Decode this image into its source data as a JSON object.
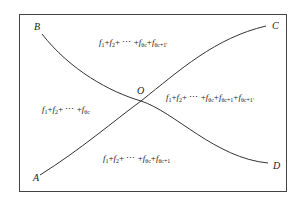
{
  "frame": {
    "x": 19,
    "y": 14,
    "width": 267,
    "height": 177,
    "stroke": "#444444"
  },
  "curves": {
    "BD": {
      "from": "B",
      "to": "D",
      "path": "M42,34 C70,70 110,92 141,101 C175,112 215,158 268,163"
    },
    "AC": {
      "from": "A",
      "to": "C",
      "path": "M40,175 C80,150 115,120 141,101 C180,70 215,38 266,26"
    }
  },
  "points": {
    "B": {
      "label": "B",
      "x": 34,
      "y": 22
    },
    "C": {
      "label": "C",
      "x": 272,
      "y": 21
    },
    "A": {
      "label": "A",
      "x": 33,
      "y": 173
    },
    "D": {
      "label": "D",
      "x": 273,
      "y": 161
    },
    "O": {
      "label": "O",
      "x": 137,
      "y": 86
    }
  },
  "regions": {
    "top": {
      "terms": [
        "f",
        "1",
        "+",
        "f",
        "2",
        "+ ⋯ +",
        "f",
        "θc",
        "+",
        "f",
        "θc+1'"
      ],
      "x": 99,
      "y": 37
    },
    "left": {
      "terms": [
        "f",
        "1",
        "+",
        "f",
        "2",
        "+ ⋯ +",
        "f",
        "θc"
      ],
      "x": 42,
      "y": 104
    },
    "right": {
      "terms": [
        "f",
        "1",
        "+",
        "f",
        "2",
        "+ ⋯ +",
        "f",
        "θc",
        "+",
        "f",
        "θc+1",
        "+",
        "f",
        "θc+1'"
      ],
      "x": 166,
      "y": 92
    },
    "bottom": {
      "terms": [
        "f",
        "1",
        "+",
        "f",
        "2",
        "+ ⋯ +",
        "f",
        "θc",
        "+",
        "f",
        "θc+1"
      ],
      "x": 103,
      "y": 153
    }
  }
}
